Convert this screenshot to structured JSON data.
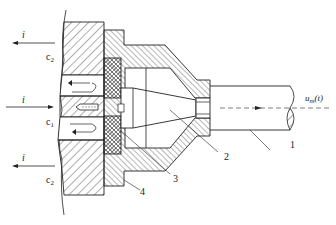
{
  "diagram": {
    "type": "engineering-cross-section",
    "line_color": "#222222",
    "background": "#ffffff"
  },
  "labels": {
    "current_top": "i",
    "current_mid": "i",
    "current_bottom": "i",
    "channel_c2_top": {
      "base": "c",
      "sub": "2"
    },
    "channel_c1": {
      "base": "c",
      "sub": "1"
    },
    "channel_c2_bottom": {
      "base": "c",
      "sub": "2"
    },
    "velocity": {
      "base": "u",
      "sub": "m",
      "arg": "(t)"
    },
    "part_1": "1",
    "part_2": "2",
    "part_3": "3",
    "part_4": "4"
  }
}
